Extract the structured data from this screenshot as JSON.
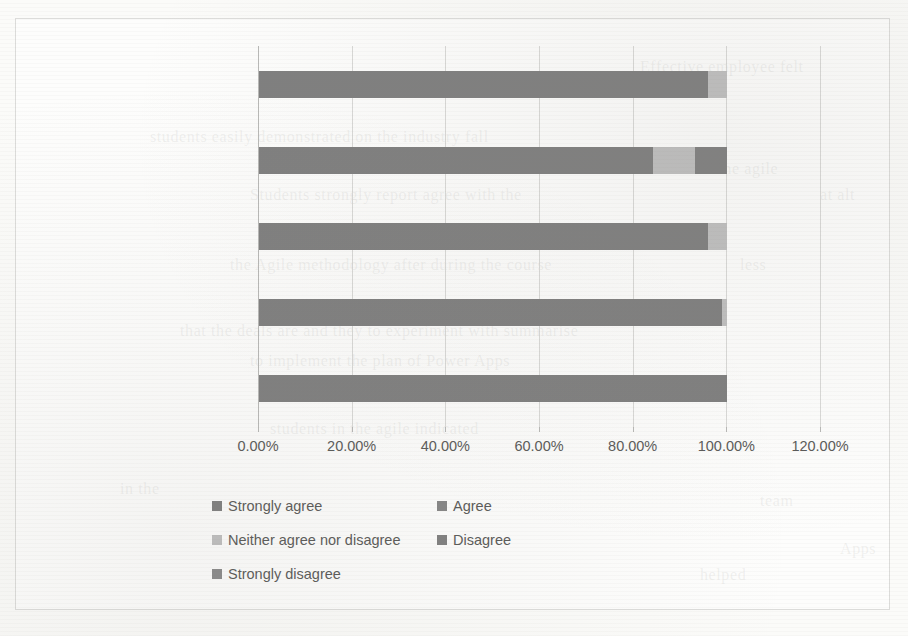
{
  "chart_data": {
    "type": "bar",
    "orientation": "horizontal",
    "stacked": "percent",
    "title": "",
    "xlabel": "",
    "ylabel": "",
    "grid": true,
    "legend_position": "bottom",
    "xlim": [
      0,
      120
    ],
    "xticks": [
      0,
      20,
      40,
      60,
      80,
      100,
      120
    ],
    "xtick_labels": [
      "0.00%",
      "20.00%",
      "40.00%",
      "60.00%",
      "80.00%",
      "100.00%",
      "120.00%"
    ],
    "categories": [
      "Effective employee",
      "Harder to learn",
      "Power Apps helped",
      "Comfort with the agile",
      "Understand agile"
    ],
    "series": [
      {
        "name": "Strongly agree",
        "color": "#7f7f7f",
        "values": [
          95.8,
          84.2,
          95.8,
          98.9,
          100.0
        ]
      },
      {
        "name": "Agree",
        "color": "#868686",
        "values": [
          0.0,
          0.0,
          0.0,
          0.0,
          0.0
        ]
      },
      {
        "name": "Neither agree nor disagree",
        "color": "#bfbfbf",
        "values": [
          4.2,
          9.0,
          4.2,
          1.1,
          0.0
        ]
      },
      {
        "name": "Disagree",
        "color": "#808080",
        "values": [
          0.0,
          6.8,
          0.0,
          0.0,
          0.0
        ]
      },
      {
        "name": "Strongly disagree",
        "color": "#8a8a8a",
        "values": [
          0.0,
          0.0,
          0.0,
          0.0,
          0.0
        ]
      }
    ]
  },
  "legend": {
    "rows": [
      [
        "Strongly agree",
        "Agree"
      ],
      [
        "Neither agree nor disagree",
        "Disagree"
      ],
      [
        "Strongly disagree"
      ]
    ]
  },
  "ghost_text": [
    {
      "t": "Effective employee felt",
      "x": 640,
      "y": 58
    },
    {
      "t": "students easily demonstrated on the industry fall",
      "x": 150,
      "y": 128
    },
    {
      "t": "to the agile",
      "x": 700,
      "y": 160
    },
    {
      "t": "Students strongly report agree with the",
      "x": 250,
      "y": 186
    },
    {
      "t": "at alt",
      "x": 820,
      "y": 186
    },
    {
      "t": "the Agile methodology after during the course",
      "x": 230,
      "y": 256
    },
    {
      "t": "less",
      "x": 740,
      "y": 256
    },
    {
      "t": "that the deals are and they to experiment with summarise",
      "x": 180,
      "y": 322
    },
    {
      "t": "to implement the plan of Power Apps",
      "x": 250,
      "y": 352
    },
    {
      "t": "students in the agile indicated",
      "x": 270,
      "y": 420
    },
    {
      "t": "in the",
      "x": 120,
      "y": 480
    },
    {
      "t": "team",
      "x": 760,
      "y": 492
    },
    {
      "t": "Apps",
      "x": 840,
      "y": 540
    },
    {
      "t": "helped",
      "x": 700,
      "y": 566
    }
  ]
}
